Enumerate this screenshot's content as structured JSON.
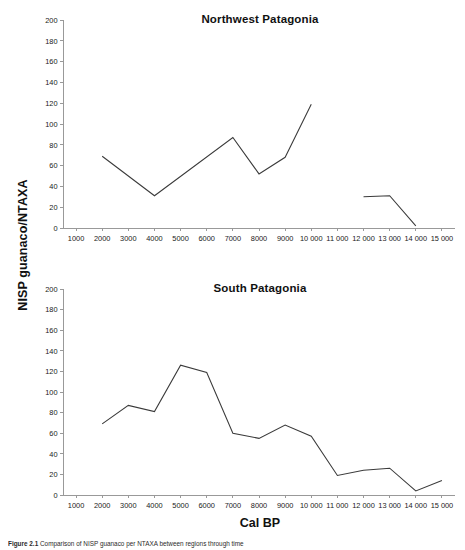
{
  "figure": {
    "axis_y_label": "NISP guanaco/NTAXA",
    "axis_x_label": "Cal BP",
    "caption_prefix": "Figure 2.1",
    "caption_text": "Comparison of NISP guanaco per NTAXA between regions through time"
  },
  "panels": {
    "northwest": {
      "title": "Northwest Patagonia"
    },
    "south": {
      "title": "South Patagonia"
    }
  },
  "axis": {
    "y_ticks": [
      "0",
      "20",
      "40",
      "60",
      "80",
      "100",
      "120",
      "140",
      "160",
      "180",
      "200"
    ],
    "x_ticks": [
      "1000",
      "2000",
      "3000",
      "4000",
      "5000",
      "6000",
      "7000",
      "8000",
      "9000",
      "10 000",
      "11 000",
      "12 000",
      "13 000",
      "14 000",
      "15 000"
    ]
  },
  "chart_data": [
    {
      "type": "line",
      "title": "Northwest Patagonia",
      "xlabel": "Cal BP",
      "ylabel": "NISP guanaco/NTAXA",
      "xlim": [
        500,
        15500
      ],
      "ylim": [
        0,
        200
      ],
      "ytick_step": 20,
      "xtick_step": 1000,
      "grid": false,
      "legend": "none",
      "series": [
        {
          "name": "Northwest Patagonia",
          "segments": [
            {
              "x": [
                2000,
                4000,
                7000,
                8000,
                9000,
                10000
              ],
              "y": [
                69,
                31,
                87,
                52,
                68,
                119
              ]
            },
            {
              "x": [
                12000,
                13000,
                14000
              ],
              "y": [
                30,
                31,
                2
              ]
            }
          ]
        }
      ]
    },
    {
      "type": "line",
      "title": "South Patagonia",
      "xlabel": "Cal BP",
      "ylabel": "NISP guanaco/NTAXA",
      "xlim": [
        500,
        15500
      ],
      "ylim": [
        0,
        200
      ],
      "ytick_step": 20,
      "xtick_step": 1000,
      "grid": false,
      "legend": "none",
      "series": [
        {
          "name": "South Patagonia",
          "segments": [
            {
              "x": [
                2000,
                3000,
                4000,
                5000,
                6000,
                7000,
                8000,
                9000,
                10000,
                11000,
                12000,
                13000,
                14000,
                15000
              ],
              "y": [
                69,
                87,
                81,
                126,
                119,
                60,
                55,
                68,
                57,
                19,
                24,
                26,
                4,
                14
              ]
            }
          ]
        }
      ]
    }
  ]
}
